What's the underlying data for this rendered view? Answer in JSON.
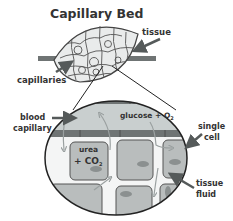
{
  "title": "Capillary Bed",
  "labels": {
    "tissue": "tissue",
    "capillaries": "capillaries",
    "blood_capillary_1": "blood",
    "blood_capillary_2": "capillary",
    "glucose_o2": "glucose + O",
    "o2_sub": "2",
    "single_cell_1": "single",
    "single_cell_2": "cell",
    "urea": "urea",
    "co2": "+ CO",
    "co2_sub": "2",
    "tissue_fluid_1": "tissue",
    "tissue_fluid_2": "fluid"
  },
  "colors": {
    "capillary_fill": "#c9cfcf",
    "vessel_wall": "#6f7474",
    "cell_fill": "#b9bdbd",
    "nucleus": "#8b9090",
    "arrow": "#555a5a",
    "outline": "#2b2b2b",
    "flow_arrow": "#9aa0a0"
  }
}
